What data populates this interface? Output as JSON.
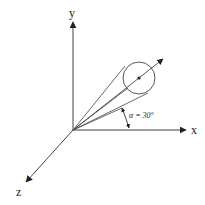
{
  "diagram": {
    "type": "3d-coordinate-axes-with-cone",
    "colors": {
      "background": "#ffffff",
      "stroke": "#333333",
      "label": "#222222"
    },
    "axes": {
      "x": {
        "label": "x"
      },
      "y": {
        "label": "y"
      },
      "z": {
        "label": "z"
      }
    },
    "angle_annotation": {
      "symbol": "α",
      "text": "α = 30°"
    },
    "elements": [
      "x-axis arrow",
      "y-axis arrow",
      "z-axis arrow",
      "cone lines from origin tangent to circle",
      "circle with center point",
      "direction arrow through circle center",
      "angle arc between cone edge and x-axis"
    ],
    "caption": ""
  }
}
